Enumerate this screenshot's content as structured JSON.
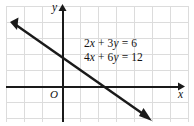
{
  "figure": {
    "type": "coordinate-plane-graph",
    "background_color": "#ffffff",
    "grid_color": "#d9d9d9",
    "axis_color": "#1a1a1a",
    "line_color": "#1a1a1a"
  },
  "axes": {
    "x_label": "x",
    "y_label": "y",
    "origin_label": "O"
  },
  "equations": [
    {
      "text": "2x + 3y = 6",
      "html": "2<i>x</i> + 3<i>y</i> = 6"
    },
    {
      "text": "4x + 6y = 12",
      "html": "4<i>x</i> + 6<i>y</i> = 12"
    }
  ],
  "chart_data": {
    "type": "line",
    "title": "",
    "xlabel": "x",
    "ylabel": "y",
    "grid": true,
    "legend": "none",
    "annotations": [
      "2x + 3y = 6",
      "4x + 6y = 12",
      "O"
    ],
    "xlim": [
      -3,
      7
    ],
    "ylim": [
      -2,
      5
    ],
    "series": [
      {
        "name": "2x + 3y = 6 and 4x + 6y = 12 (coincident lines)",
        "slope": -0.6666666667,
        "y_intercept": 2,
        "x_intercept": 3,
        "points": [
          [
            -3,
            4
          ],
          [
            0,
            2
          ],
          [
            3,
            0
          ],
          [
            6,
            -2
          ]
        ],
        "arrows": "both"
      }
    ]
  }
}
